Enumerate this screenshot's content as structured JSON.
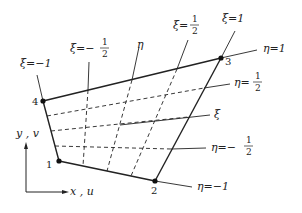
{
  "figure": {
    "nodes": [
      {
        "id": "1",
        "x": 59,
        "y": 161
      },
      {
        "id": "2",
        "x": 155,
        "y": 181
      },
      {
        "id": "3",
        "x": 221,
        "y": 58
      },
      {
        "id": "4",
        "x": 43,
        "y": 101
      }
    ],
    "xi_lines": [
      {
        "label": "ξ=−1",
        "value": -1
      },
      {
        "label": "ξ=−1/2",
        "value": -0.5
      },
      {
        "label": "η",
        "value": 0
      },
      {
        "label": "ξ=1/2",
        "value": 0.5
      },
      {
        "label": "ξ=1",
        "value": 1
      }
    ],
    "eta_lines": [
      {
        "label": "η=1",
        "value": 1
      },
      {
        "label": "η=1/2",
        "value": 0.5
      },
      {
        "label": "ξ",
        "value": 0
      },
      {
        "label": "η=−1/2",
        "value": -0.5
      },
      {
        "label": "η=−1",
        "value": -1
      }
    ],
    "labels": {
      "xi_m1": "ξ=−1",
      "xi_mhalf_prefix": "ξ=−",
      "xi_half_prefix": "ξ=",
      "xi_1": "ξ=1",
      "eta_axis": "η",
      "xi_axis": "ξ",
      "eta_1": "η=1",
      "eta_half_prefix": "η=",
      "eta_mhalf_prefix": "η=−",
      "eta_m1": "η=−1",
      "frac_num": "1",
      "frac_den": "2",
      "node1": "1",
      "node2": "2",
      "node3": "3",
      "node4": "4",
      "y_axis": "y , v",
      "x_axis": "x , u"
    }
  }
}
